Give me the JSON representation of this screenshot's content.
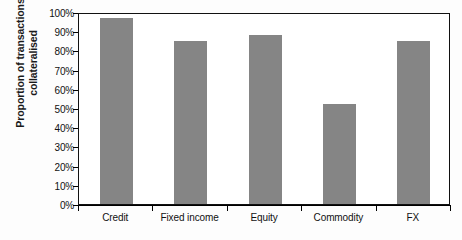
{
  "chart_data": {
    "type": "bar",
    "title": "",
    "xlabel": "",
    "ylabel": "Proportion of transactions collateralised",
    "ylabel_lines": [
      "Proportion of transactions",
      "collateralised"
    ],
    "categories": [
      "Credit",
      "Fixed income",
      "Equity",
      "Commodity",
      "FX"
    ],
    "values": [
      97,
      85,
      88,
      52,
      85
    ],
    "values_display": [
      "97%",
      "85%",
      "88%",
      "52%",
      "85%"
    ],
    "ylim": [
      0,
      100
    ],
    "ytick_values": [
      0,
      10,
      20,
      30,
      40,
      50,
      60,
      70,
      80,
      90,
      100
    ],
    "ytick_labels": [
      "0%",
      "10%",
      "20%",
      "30%",
      "40%",
      "50%",
      "60%",
      "70%",
      "80%",
      "90%",
      "100%"
    ],
    "grid": false,
    "legend": null,
    "legend_position": "none",
    "series": [
      {
        "name": "Proportion of transactions collateralised",
        "values": [
          97,
          85,
          88,
          52,
          85
        ]
      }
    ],
    "colors": {
      "bar_fill": "#858585",
      "axis": "#111111",
      "plot_background": "#ffffff",
      "figure_background": "#fdfdfd",
      "text": "#111111"
    }
  }
}
